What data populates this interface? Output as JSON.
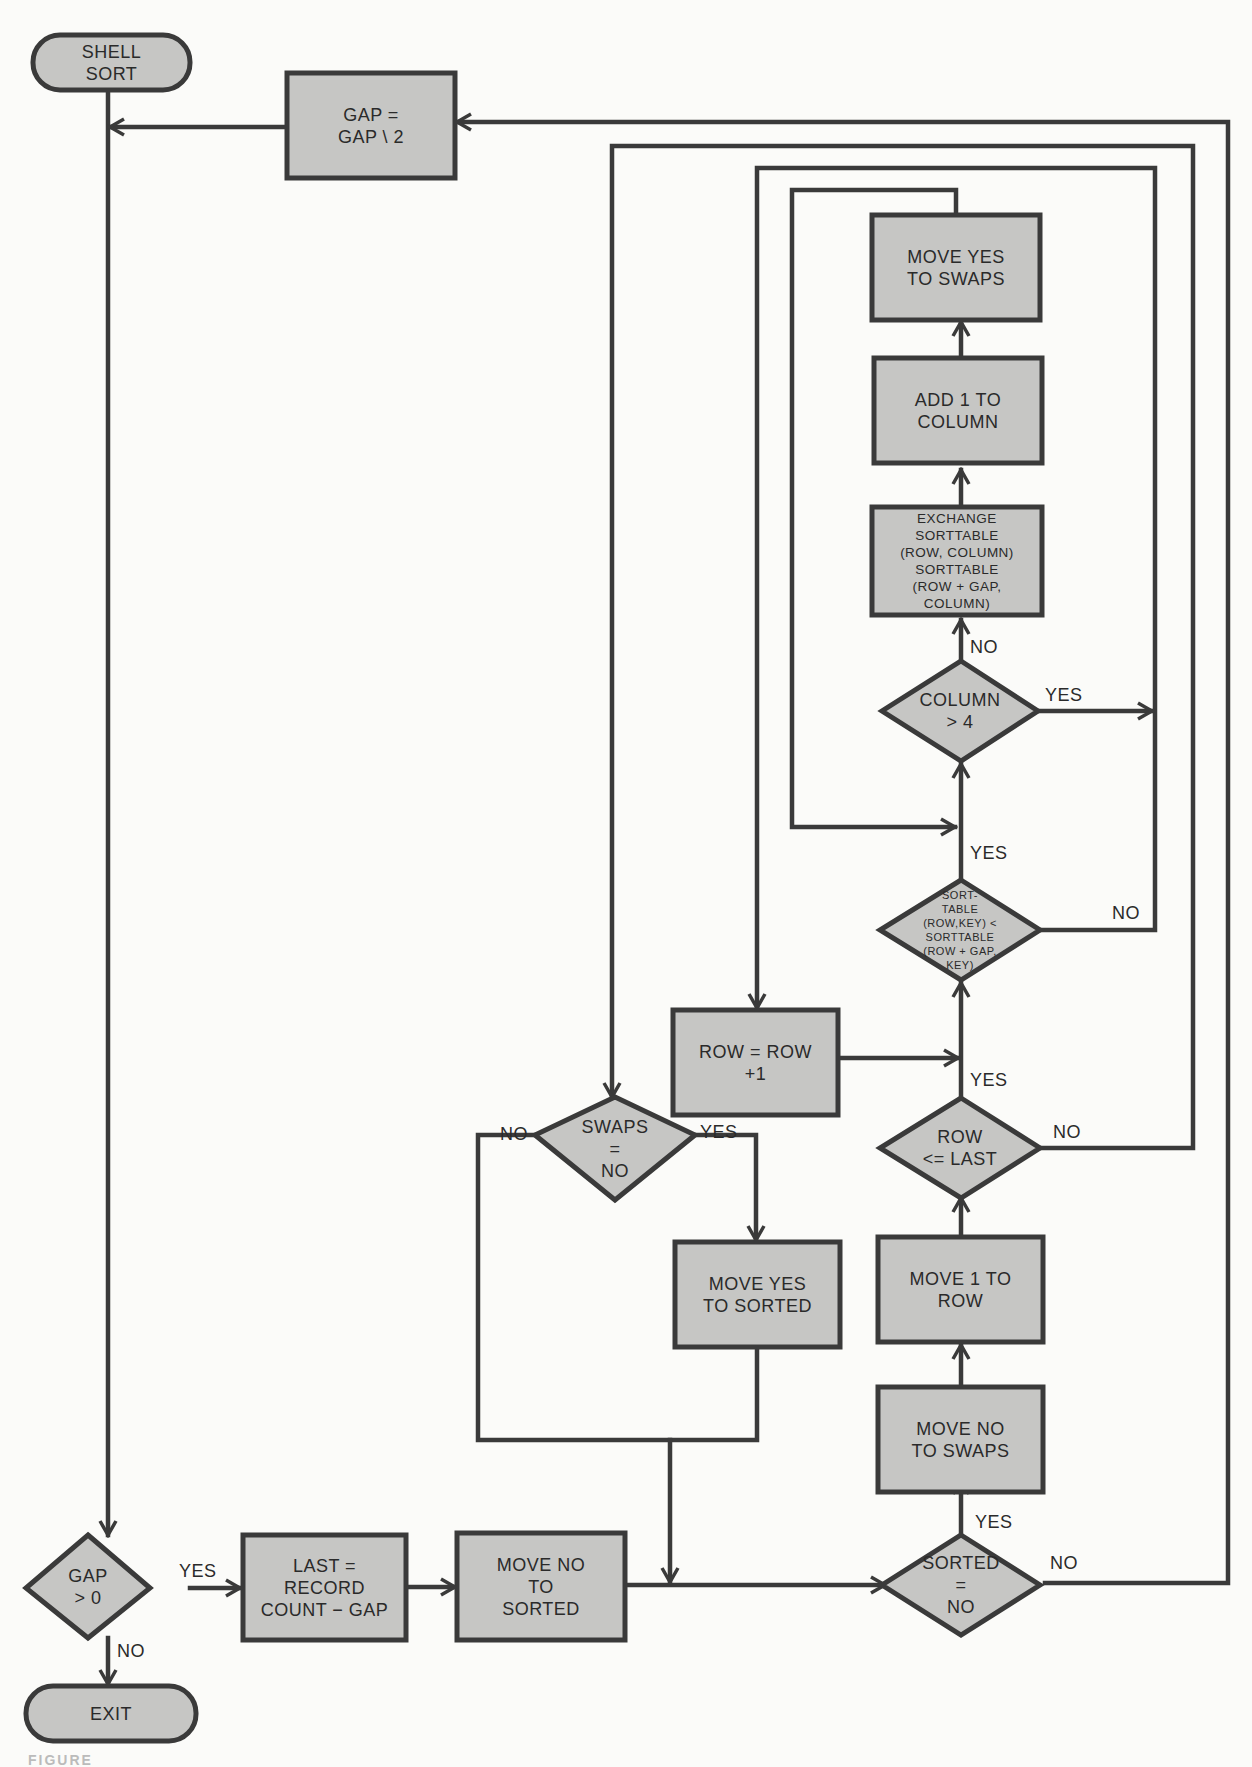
{
  "diagram": {
    "title": "SHELL SORT",
    "type": "flowchart",
    "colors": {
      "fill": "#c6c6c4",
      "stroke": "#3a3a3a",
      "background": "#fbfbf9",
      "text": "#2a2a2a"
    },
    "nodes": {
      "start": {
        "shape": "terminal",
        "lines": [
          "SHELL",
          "SORT"
        ]
      },
      "gap_halve": {
        "shape": "process",
        "lines": [
          "GAP =",
          "GAP \\ 2"
        ]
      },
      "move_yes_swaps": {
        "shape": "process",
        "lines": [
          "MOVE YES",
          "TO SWAPS"
        ]
      },
      "add_column": {
        "shape": "process",
        "lines": [
          "ADD 1 TO",
          "COLUMN"
        ]
      },
      "exchange": {
        "shape": "process",
        "lines": [
          "EXCHANGE",
          "SORTTABLE",
          "(ROW, COLUMN)",
          "SORTTABLE",
          "(ROW + GAP,",
          "COLUMN)"
        ]
      },
      "column_gt4": {
        "shape": "decision",
        "lines": [
          "COLUMN",
          "> 4"
        ]
      },
      "compare": {
        "shape": "decision",
        "lines": [
          "SORT-",
          "TABLE",
          "(ROW,KEY) <",
          "SORTTABLE",
          "(ROW + GAP,",
          "KEY)"
        ]
      },
      "row_inc": {
        "shape": "process",
        "lines": [
          "ROW = ROW",
          "+1"
        ]
      },
      "swaps_no": {
        "shape": "decision",
        "lines": [
          "SWAPS",
          "=",
          "NO"
        ]
      },
      "row_le_last": {
        "shape": "decision",
        "lines": [
          "ROW",
          "<= LAST"
        ]
      },
      "move_yes_sorted": {
        "shape": "process",
        "lines": [
          "MOVE YES",
          "TO SORTED"
        ]
      },
      "move_1_row": {
        "shape": "process",
        "lines": [
          "MOVE 1 TO",
          "ROW"
        ]
      },
      "move_no_swaps": {
        "shape": "process",
        "lines": [
          "MOVE NO",
          "TO SWAPS"
        ]
      },
      "gap_gt0": {
        "shape": "decision",
        "lines": [
          "GAP",
          "> 0"
        ]
      },
      "last_calc": {
        "shape": "process",
        "lines": [
          "LAST =",
          "RECORD",
          "COUNT − GAP"
        ]
      },
      "move_no_sorted": {
        "shape": "process",
        "lines": [
          "MOVE NO",
          "TO",
          "SORTED"
        ]
      },
      "sorted_no": {
        "shape": "decision",
        "lines": [
          "SORTED",
          "=",
          "NO"
        ]
      },
      "exit": {
        "shape": "terminal",
        "lines": [
          "EXIT"
        ]
      }
    },
    "edge_labels": {
      "exchange_no": "NO",
      "column_yes": "YES",
      "compare_yes": "YES",
      "compare_no": "NO",
      "row_le_yes": "YES",
      "row_le_no": "NO",
      "swaps_no_label": "NO",
      "swaps_yes_label": "YES",
      "gap_yes": "YES",
      "gap_no": "NO",
      "sorted_yes": "YES",
      "sorted_no_label": "NO"
    },
    "edges": [
      {
        "from": "start",
        "to": "gap_gt0"
      },
      {
        "from": "gap_halve",
        "to": "gap_gt0"
      },
      {
        "from": "gap_gt0",
        "to": "last_calc",
        "label": "YES"
      },
      {
        "from": "gap_gt0",
        "to": "exit",
        "label": "NO"
      },
      {
        "from": "last_calc",
        "to": "move_no_sorted"
      },
      {
        "from": "move_no_sorted",
        "to": "sorted_no"
      },
      {
        "from": "sorted_no",
        "to": "move_no_swaps",
        "label": "YES"
      },
      {
        "from": "sorted_no",
        "to": "gap_halve",
        "label": "NO"
      },
      {
        "from": "move_no_swaps",
        "to": "move_1_row"
      },
      {
        "from": "move_1_row",
        "to": "row_le_last"
      },
      {
        "from": "row_le_last",
        "to": "compare",
        "label": "YES"
      },
      {
        "from": "row_le_last",
        "to": "swaps_no",
        "label": "NO"
      },
      {
        "from": "compare",
        "to": "column_gt4",
        "label": "YES"
      },
      {
        "from": "compare",
        "to": "row_inc",
        "label": "NO"
      },
      {
        "from": "column_gt4",
        "to": "exchange",
        "label": "NO"
      },
      {
        "from": "column_gt4",
        "to": "row_inc",
        "label": "YES"
      },
      {
        "from": "exchange",
        "to": "add_column"
      },
      {
        "from": "add_column",
        "to": "move_yes_swaps"
      },
      {
        "from": "move_yes_swaps",
        "to": "column_gt4"
      },
      {
        "from": "row_inc",
        "to": "compare"
      },
      {
        "from": "swaps_no",
        "to": "move_yes_sorted",
        "label": "YES"
      },
      {
        "from": "swaps_no",
        "to": "sorted_no",
        "label": "NO"
      },
      {
        "from": "move_yes_sorted",
        "to": "sorted_no"
      }
    ],
    "caption": "FIGURE"
  }
}
